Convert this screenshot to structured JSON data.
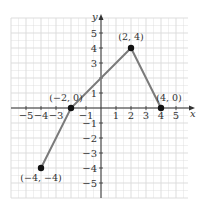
{
  "chart_data": {
    "type": "line",
    "title": "",
    "xlabel": "x",
    "ylabel": "y",
    "xlim": [
      -6,
      6
    ],
    "ylim": [
      -6,
      6
    ],
    "grid": true,
    "x_ticks": [
      "-5",
      "-4",
      "-3",
      "-1",
      "1",
      "2",
      "3",
      "4",
      "5"
    ],
    "y_ticks": [
      "5",
      "4",
      "3",
      "1",
      "-1",
      "-2",
      "-3",
      "-4",
      "-5"
    ],
    "x": [
      -4,
      -2,
      2,
      4
    ],
    "y": [
      -4,
      0,
      4,
      0
    ],
    "points": [
      {
        "x": -4,
        "y": -4,
        "label": "(−4, −4)"
      },
      {
        "x": -2,
        "y": 0,
        "label": "(−2, 0)"
      },
      {
        "x": 2,
        "y": 4,
        "label": "(2, 4)"
      },
      {
        "x": 4,
        "y": 0,
        "label": "(4, 0)"
      }
    ],
    "colors": {
      "line": "#7a7a7a",
      "point": "#111111",
      "grid": "#d9d9d9",
      "axis": "#333333"
    }
  }
}
